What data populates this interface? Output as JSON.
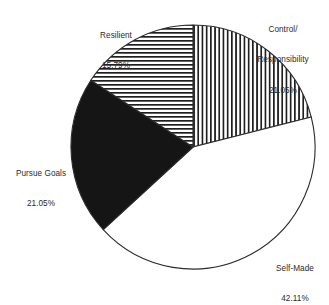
{
  "chart_data": {
    "type": "pie",
    "title": "",
    "subtitle": "",
    "xlabel": "",
    "ylabel": "",
    "legend_position": "none",
    "grid": false,
    "label_format": "name above percentage, placed outside slice",
    "start_angle_deg": 0,
    "direction": "clockwise",
    "categories": [
      "Control/ Responsibility",
      "Self-Made",
      "Pursue Goals",
      "Resilient"
    ],
    "values": [
      21.05,
      42.11,
      21.05,
      15.79
    ],
    "value_unit": "percent",
    "total": 100,
    "slices": [
      {
        "id": "control-responsibility",
        "name_line1": "Control/",
        "name_line2": "Responsibility",
        "percent_text": "21.05%",
        "value": 21.05,
        "fill": "vertical-stripes",
        "fill_color": "#ffffff",
        "stripe_color": "#1f1f1f",
        "start_deg": 0,
        "end_deg": 75.78
      },
      {
        "id": "self-made",
        "name_line1": "Self-Made",
        "name_line2": "",
        "percent_text": "42.11%",
        "value": 42.11,
        "fill": "solid-white",
        "fill_color": "#ffffff",
        "stripe_color": "",
        "start_deg": 75.78,
        "end_deg": 227.38
      },
      {
        "id": "pursue-goals",
        "name_line1": "Pursue Goals",
        "name_line2": "",
        "percent_text": "21.05%",
        "value": 21.05,
        "fill": "solid-black",
        "fill_color": "#151515",
        "stripe_color": "",
        "start_deg": 227.38,
        "end_deg": 303.16
      },
      {
        "id": "resilient",
        "name_line1": "Resilient",
        "name_line2": "",
        "percent_text": "15.79%",
        "value": 15.79,
        "fill": "horizontal-stripes",
        "fill_color": "#ffffff",
        "stripe_color": "#1f1f1f",
        "start_deg": 303.16,
        "end_deg": 360
      }
    ],
    "colors": {
      "outline": "#2b2b2b",
      "black_slice": "#151515",
      "white_slice": "#ffffff",
      "hatch": "#1f1f1f",
      "text": "#2a2a2a",
      "background": "#ffffff"
    },
    "geometry": {
      "center_x": 193,
      "center_y": 147,
      "radius": 122
    }
  },
  "labels": {
    "control": {
      "name_line1": "Control/",
      "name_line2": "Responsibility",
      "percent": "21.05%"
    },
    "resilient": {
      "name": "Resilient",
      "percent": "15.79%"
    },
    "pursue": {
      "name": "Pursue Goals",
      "percent": "21.05%"
    },
    "selfmade": {
      "name": "Self-Made",
      "percent": "42.11%"
    }
  }
}
